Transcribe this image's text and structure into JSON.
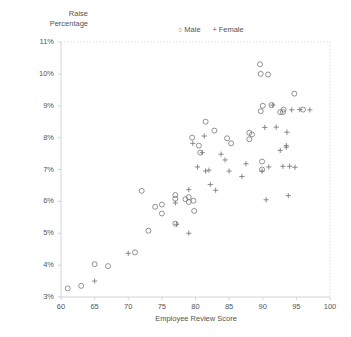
{
  "chart_data": {
    "type": "scatter",
    "title": "",
    "xlabel": "Employee Review Score",
    "ylabel": "Raise\nPercentage",
    "xlim": [
      60,
      100
    ],
    "ylim": [
      3,
      11
    ],
    "xticks": [
      60,
      65,
      70,
      75,
      80,
      85,
      90,
      95,
      100
    ],
    "xtick_labels": [
      "60",
      "65",
      "70",
      "75",
      "80",
      "85",
      "90",
      "95",
      "100"
    ],
    "yticks": [
      3,
      4,
      5,
      6,
      7,
      8,
      9,
      10,
      11
    ],
    "ytick_labels": [
      "3%",
      "4%",
      "5%",
      "6%",
      "7%",
      "8%",
      "9%",
      "10%",
      "11%"
    ],
    "grid": false,
    "legend_position": "top-center",
    "series": [
      {
        "name": "Male",
        "marker": "circle",
        "color": "#777777",
        "points": [
          [
            61.0,
            3.27
          ],
          [
            63.0,
            3.35
          ],
          [
            65.0,
            4.03
          ],
          [
            67.0,
            3.97
          ],
          [
            71.0,
            4.4
          ],
          [
            72.0,
            6.33
          ],
          [
            73.0,
            5.08
          ],
          [
            74.0,
            5.83
          ],
          [
            75.0,
            5.9
          ],
          [
            75.0,
            5.62
          ],
          [
            77.0,
            6.2
          ],
          [
            77.0,
            6.08
          ],
          [
            77.0,
            5.3
          ],
          [
            78.5,
            6.07
          ],
          [
            79.0,
            6.13
          ],
          [
            79.0,
            5.98
          ],
          [
            79.5,
            8.0
          ],
          [
            79.7,
            6.02
          ],
          [
            79.8,
            5.7
          ],
          [
            80.5,
            7.75
          ],
          [
            80.7,
            7.53
          ],
          [
            81.5,
            8.5
          ],
          [
            82.8,
            8.22
          ],
          [
            84.7,
            7.98
          ],
          [
            85.3,
            7.82
          ],
          [
            88.0,
            8.15
          ],
          [
            88.0,
            7.95
          ],
          [
            88.4,
            8.1
          ],
          [
            89.6,
            10.3
          ],
          [
            89.7,
            10.0
          ],
          [
            89.7,
            8.83
          ],
          [
            89.9,
            7.0
          ],
          [
            89.9,
            7.25
          ],
          [
            90.0,
            9.0
          ],
          [
            90.8,
            9.98
          ],
          [
            91.3,
            9.02
          ],
          [
            92.6,
            8.8
          ],
          [
            93.0,
            8.8
          ],
          [
            93.1,
            8.88
          ],
          [
            94.7,
            9.38
          ],
          [
            96.0,
            8.88
          ]
        ]
      },
      {
        "name": "Female",
        "marker": "plus",
        "color": "#777777",
        "points": [
          [
            65.0,
            3.5
          ],
          [
            70.0,
            4.37
          ],
          [
            77.0,
            5.95
          ],
          [
            77.2,
            5.28
          ],
          [
            79.0,
            6.37
          ],
          [
            79.0,
            5.0
          ],
          [
            79.6,
            7.82
          ],
          [
            80.3,
            7.08
          ],
          [
            81.0,
            7.53
          ],
          [
            81.3,
            8.05
          ],
          [
            81.5,
            6.95
          ],
          [
            82.0,
            6.98
          ],
          [
            82.2,
            6.53
          ],
          [
            83.0,
            6.35
          ],
          [
            83.8,
            7.48
          ],
          [
            84.4,
            7.3
          ],
          [
            85.0,
            6.95
          ],
          [
            86.9,
            6.78
          ],
          [
            87.5,
            7.18
          ],
          [
            89.9,
            6.95
          ],
          [
            90.3,
            8.32
          ],
          [
            90.5,
            6.05
          ],
          [
            91.5,
            9.02
          ],
          [
            92.0,
            8.33
          ],
          [
            92.6,
            7.6
          ],
          [
            93.0,
            7.1
          ],
          [
            93.5,
            7.7
          ],
          [
            93.5,
            7.75
          ],
          [
            93.6,
            8.17
          ],
          [
            93.8,
            6.18
          ],
          [
            94.0,
            7.1
          ],
          [
            94.3,
            8.87
          ],
          [
            94.8,
            7.07
          ],
          [
            95.5,
            8.88
          ],
          [
            97.0,
            8.87
          ],
          [
            90.9,
            7.08
          ]
        ]
      }
    ]
  },
  "legend": {
    "male_symbol": "○",
    "male_label": "Male",
    "female_symbol": "+",
    "female_label": "Female"
  }
}
